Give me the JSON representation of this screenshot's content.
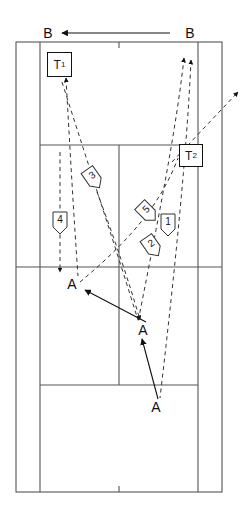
{
  "diagram": {
    "background": "#ffffff",
    "line_color": "#555555",
    "ink_color": "#111111"
  },
  "court": {
    "outer": {
      "x": 16,
      "y": 42,
      "w": 206,
      "h": 450
    },
    "singles_left_x": 40,
    "singles_right_x": 198,
    "service_line_top_y": 145,
    "service_line_bottom_y": 385,
    "net_y": 267,
    "center_service_line_x": 119,
    "center_mark_top": {
      "x": 119,
      "y": 42,
      "len": 6
    },
    "center_mark_bottom": {
      "x": 119,
      "y": 492,
      "len": 6
    }
  },
  "labels": {
    "b_left": "B",
    "b_right": "B",
    "a_left": "A",
    "a_middle": "A",
    "a_bottom": "A",
    "t1": "T",
    "t1_sub": "1",
    "t2": "T",
    "t2_sub": "2"
  },
  "players": [
    {
      "id": "1",
      "label": "1",
      "x": 168,
      "y": 223,
      "rotation": 0
    },
    {
      "id": "2",
      "label": "2",
      "x": 151,
      "y": 245,
      "rotation": -35
    },
    {
      "id": "3",
      "label": "3",
      "x": 92,
      "y": 177,
      "rotation": -35
    },
    {
      "id": "4",
      "label": "4",
      "x": 60,
      "y": 221,
      "rotation": 0
    },
    {
      "id": "5",
      "label": "5",
      "x": 146,
      "y": 211,
      "rotation": -45
    }
  ],
  "t_boxes": [
    {
      "id": "T1",
      "x": 47,
      "y": 52,
      "w": 23,
      "h": 23
    },
    {
      "id": "T2",
      "x": 179,
      "y": 144,
      "w": 22,
      "h": 21
    }
  ],
  "a_markers": [
    {
      "id": "a-left",
      "x": 72,
      "y": 283
    },
    {
      "id": "a-middle",
      "x": 143,
      "y": 329
    },
    {
      "id": "a-bottom",
      "x": 155,
      "y": 406
    }
  ],
  "b_markers": [
    {
      "id": "b-left",
      "x": 48,
      "y": 33
    },
    {
      "id": "b-right",
      "x": 190,
      "y": 33
    }
  ],
  "solid_arrows": [
    {
      "id": "b-top-arrow",
      "x1": 170,
      "y1": 33,
      "x2": 60,
      "y2": 33
    },
    {
      "id": "a-middle-to-a-left",
      "x1": 146,
      "y1": 322,
      "x2": 84,
      "y2": 290
    },
    {
      "id": "a-bottom-to-a-middle",
      "x1": 158,
      "y1": 399,
      "x2": 142,
      "y2": 338
    }
  ],
  "dashed_paths": [
    {
      "id": "path-t1-from-a-left",
      "points": "66,77 72,160 78,275",
      "arrow_at_start": true
    },
    {
      "id": "path-t1-to-a-middle",
      "points": "62,80 100,200 138,320",
      "arrow_at_start": false
    },
    {
      "id": "path-a-left-descend",
      "points": "60,150 60,270",
      "arrow_at_end": true
    },
    {
      "id": "path-3-to-a-middle",
      "points": "96,190 120,250 140,320",
      "arrow_at_end": true
    },
    {
      "id": "path-right-up-a",
      "points": "184,56 174,130 160,210 146,290 136,322",
      "arrow_at_start": true
    },
    {
      "id": "path-right-up-b",
      "points": "190,58 186,140 178,240 168,330 160,400",
      "arrow_at_start": true
    },
    {
      "id": "path-t2-exit-right",
      "points": "172,160 205,125 238,92",
      "arrow_at_end": true
    },
    {
      "id": "path-a-bottom-up",
      "points": "156,398 150,330 144,270 140,210",
      "arrow_at_end": false
    },
    {
      "id": "path-cross-left",
      "points": "80,282 120,250 160,212 178,160",
      "arrow_at_end": false
    }
  ]
}
